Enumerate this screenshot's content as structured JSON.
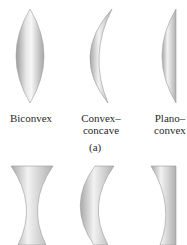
{
  "figure": {
    "panel_a": {
      "label": "(a)",
      "lenses": [
        {
          "name": "biconvex",
          "line1": "Biconvex",
          "line2": ""
        },
        {
          "name": "convex-concave",
          "line1": "Convex–",
          "line2": "concave"
        },
        {
          "name": "plano-convex",
          "line1": "Plano–",
          "line2": "convex"
        }
      ]
    },
    "panel_b": {
      "lenses": [
        {
          "name": "biconcave"
        },
        {
          "name": "concave-convex"
        },
        {
          "name": "plano-concave"
        }
      ]
    },
    "colors": {
      "lens_light": "#f4f4f4",
      "lens_mid": "#c8c8c8",
      "lens_dark": "#8e8e8e",
      "text": "#2a2a2a"
    }
  }
}
